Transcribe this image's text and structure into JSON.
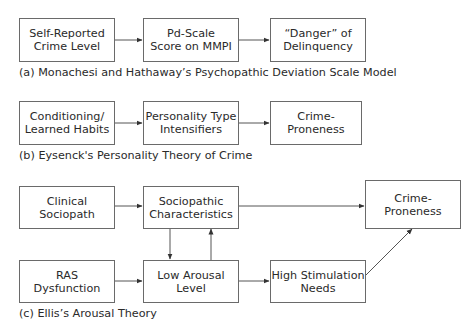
{
  "diagram_a": {
    "caption": "(a) Monachesi and Hathaway’s Psychopathic Deviation Scale Model",
    "nodes": [
      {
        "id": "self_reported",
        "label": "Self-Reported\nCrime Level"
      },
      {
        "id": "pd_scale",
        "label": "Pd-Scale\nScore on MMPI"
      },
      {
        "id": "danger",
        "label": "“Danger” of\nDelinquency"
      }
    ],
    "edges": [
      [
        "self_reported",
        "pd_scale"
      ],
      [
        "pd_scale",
        "danger"
      ]
    ]
  },
  "diagram_b": {
    "caption": "(b) Eysenck's Personality Theory of Crime",
    "nodes": [
      {
        "id": "conditioning",
        "label": "Conditioning/\nLearned Habits"
      },
      {
        "id": "personality",
        "label": "Personality Type\nIntensifiers"
      },
      {
        "id": "crime_b",
        "label": "Crime-Proneness"
      }
    ],
    "edges": [
      [
        "conditioning",
        "personality"
      ],
      [
        "personality",
        "crime_b"
      ]
    ]
  },
  "diagram_c": {
    "caption": "(c) Ellis’s Arousal Theory",
    "nodes": [
      {
        "id": "clinical",
        "label": "Clinical\nSociopath"
      },
      {
        "id": "socio_char",
        "label": "Sociopathic\nCharacteristics"
      },
      {
        "id": "crime_c",
        "label": "Crime-Proneness"
      },
      {
        "id": "ras",
        "label": "RAS\nDysfunction"
      },
      {
        "id": "low_arousal",
        "label": "Low Arousal\nLevel"
      },
      {
        "id": "high_stim",
        "label": "High Stimulation\nNeeds"
      }
    ],
    "edges": [
      [
        "clinical",
        "socio_char"
      ],
      [
        "socio_char",
        "crime_c"
      ],
      [
        "socio_char",
        "low_arousal"
      ],
      [
        "low_arousal",
        "socio_char"
      ],
      [
        "ras",
        "low_arousal"
      ],
      [
        "low_arousal",
        "high_stim"
      ],
      [
        "high_stim",
        "crime_c"
      ]
    ]
  }
}
